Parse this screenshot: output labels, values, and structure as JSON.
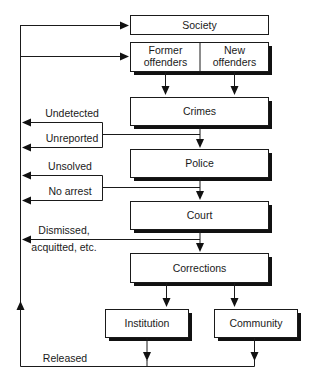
{
  "diagram": {
    "type": "flowchart",
    "nodes": {
      "society": "Society",
      "former_offenders": [
        "Former",
        "offenders"
      ],
      "new_offenders": [
        "New",
        "offenders"
      ],
      "crimes": "Crimes",
      "police": "Police",
      "court": "Court",
      "corrections": "Corrections",
      "institution": "Institution",
      "community": "Community"
    },
    "exit_labels": {
      "undetected": "Undetected",
      "unreported": "Unreported",
      "unsolved": "Unsolved",
      "no_arrest": "No arrest",
      "dismissed": [
        "Dismissed,",
        "acquitted, etc."
      ],
      "released": "Released"
    },
    "colors": {
      "stroke": "#1a1a1a",
      "shadow": "#111111",
      "background": "#ffffff"
    }
  }
}
